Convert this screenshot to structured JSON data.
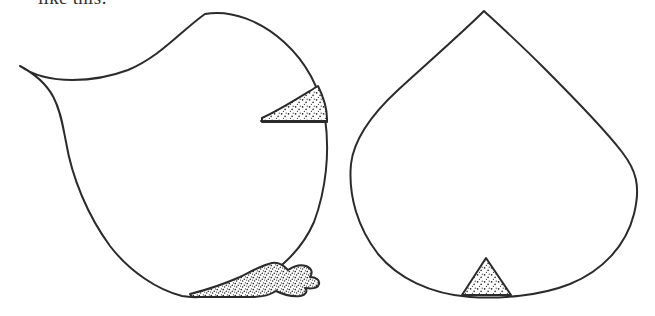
{
  "canvas": {
    "width": 655,
    "height": 316,
    "background_color": "#ffffff",
    "ink_color": "#2b2b2b",
    "medium": "pen-and-ink line drawing"
  },
  "caption": {
    "text": "like this:",
    "note": "clipped by top edge of the scan"
  },
  "figure_data": {
    "type": "line-drawing",
    "title": "",
    "shape_count": 2,
    "shapes": [
      {
        "id": "left-shape",
        "name": "left-blob-outline",
        "description": "closed free-form blob with a sharp concave cusp at upper left",
        "cusp_point": [
          20,
          66
        ],
        "apex_point": [
          205,
          12
        ],
        "bottom_point": [
          185,
          296
        ],
        "bounds": [
          14,
          11,
          325,
          298
        ],
        "fill": "none",
        "stroke": "#2b2b2b",
        "stroke_width": 2,
        "regions": [
          {
            "id": "left-upper-wedge",
            "name": "stippled-triangle-upper",
            "description": "curved-hypotenuse triangle pointing left, flush against right edge",
            "bounds": [
              261,
              87,
              326,
              123
            ],
            "fill_pattern": "stipple",
            "dot_count": 150
          },
          {
            "id": "left-lower-blob",
            "name": "stippled-wedge-lower",
            "description": "irregular notched wedge blob along the bottom right margin",
            "bounds": [
              188,
              261,
              320,
              298
            ],
            "fill_pattern": "stipple",
            "dot_count": 230
          }
        ]
      },
      {
        "id": "right-shape",
        "name": "right-teardrop-outline",
        "description": "teardrop / heart-like closed curve with a sharp apex on top",
        "apex_point": [
          484,
          11
        ],
        "left_extreme": [
          350,
          165
        ],
        "right_extreme": [
          637,
          165
        ],
        "bottom_point": [
          487,
          296
        ],
        "bounds": [
          350,
          11,
          637,
          298
        ],
        "fill": "none",
        "stroke": "#2b2b2b",
        "stroke_width": 2,
        "regions": [
          {
            "id": "right-base-triangle",
            "name": "stippled-triangle-base",
            "description": "small isoceles triangle seated on the bottom arc",
            "bounds": [
              461,
              257,
              512,
              297
            ],
            "fill_pattern": "stipple",
            "dot_count": 60
          }
        ]
      }
    ]
  }
}
